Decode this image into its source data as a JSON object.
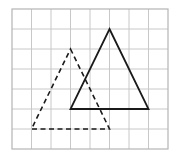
{
  "grid": {
    "columns": 8,
    "rows": 7,
    "origin_x": 12,
    "origin_y": 9,
    "cell_w": 19.5,
    "cell_h": 20,
    "line_color": "#c8c8c8",
    "border_color": "#b4b4b4"
  },
  "shapes": [
    {
      "name": "solid-triangle",
      "style": "solid",
      "color": "#1a1a1a",
      "vertices_grid": [
        [
          5,
          1
        ],
        [
          7,
          5
        ],
        [
          3,
          5
        ]
      ]
    },
    {
      "name": "dashed-triangle",
      "style": "dashed",
      "color": "#1a1a1a",
      "vertices_grid": [
        [
          3,
          2
        ],
        [
          5,
          6
        ],
        [
          1,
          6
        ]
      ]
    }
  ]
}
